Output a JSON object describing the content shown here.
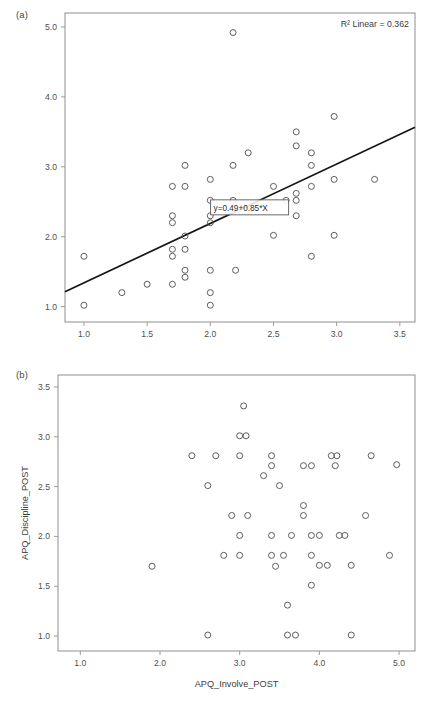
{
  "figure": {
    "panels": [
      {
        "tag": "(a)",
        "xlabel": "",
        "ylabel": "",
        "r2_label": "R² Linear = 0.362",
        "equation_label": "y=0.49+0.85*X",
        "x_ticks": [
          "1.0",
          "1.5",
          "2.0",
          "2.5",
          "3.0",
          "3.5"
        ],
        "y_ticks": [
          "1.0",
          "2.0",
          "3.0",
          "4.0",
          "5.0"
        ]
      },
      {
        "tag": "(b)",
        "xlabel": "APQ_Involve_POST",
        "ylabel": "APQ_Discipline_POST",
        "r2_label": "",
        "equation_label": "",
        "x_ticks": [
          "1.0",
          "2.0",
          "3.0",
          "4.0",
          "5.0"
        ],
        "y_ticks": [
          "1.0",
          "1.5",
          "2.0",
          "2.5",
          "3.0",
          "3.5"
        ]
      }
    ]
  },
  "colors": {
    "marker_stroke": "#555555",
    "fit_line": "#151515",
    "frame": "#9a9a9a",
    "text": "#3d3d3d",
    "background": "#ffffff"
  },
  "chart_data": [
    {
      "type": "scatter",
      "title": "(a)",
      "xlabel": "",
      "ylabel": "",
      "xlim": [
        0.85,
        3.62
      ],
      "ylim": [
        0.78,
        5.2
      ],
      "x_ticks": [
        1.0,
        1.5,
        2.0,
        2.5,
        3.0,
        3.5
      ],
      "y_ticks": [
        1.0,
        2.0,
        3.0,
        4.0,
        5.0
      ],
      "grid": false,
      "legend": "none",
      "annotations": [
        {
          "text": "R² Linear = 0.362",
          "position": "top-right"
        },
        {
          "text": "y=0.49+0.85*X",
          "position": "on-fit-line",
          "x": 2.05,
          "y": 2.42
        }
      ],
      "fit_line": {
        "type": "linear",
        "equation": "y=0.49+0.85*X",
        "intercept": 0.49,
        "slope": 0.85,
        "r_squared": 0.362
      },
      "points": [
        {
          "x": 1.0,
          "y": 1.72
        },
        {
          "x": 1.0,
          "y": 1.02
        },
        {
          "x": 1.3,
          "y": 1.2
        },
        {
          "x": 1.5,
          "y": 1.32
        },
        {
          "x": 1.7,
          "y": 2.72
        },
        {
          "x": 1.7,
          "y": 2.3
        },
        {
          "x": 1.7,
          "y": 2.2
        },
        {
          "x": 1.7,
          "y": 1.82
        },
        {
          "x": 1.7,
          "y": 1.72
        },
        {
          "x": 1.7,
          "y": 1.32
        },
        {
          "x": 1.8,
          "y": 3.02
        },
        {
          "x": 1.8,
          "y": 2.72
        },
        {
          "x": 1.8,
          "y": 2.01
        },
        {
          "x": 1.8,
          "y": 1.82
        },
        {
          "x": 1.8,
          "y": 1.52
        },
        {
          "x": 1.8,
          "y": 1.42
        },
        {
          "x": 2.0,
          "y": 2.82
        },
        {
          "x": 2.0,
          "y": 2.52
        },
        {
          "x": 2.0,
          "y": 2.3
        },
        {
          "x": 2.0,
          "y": 2.2
        },
        {
          "x": 2.0,
          "y": 1.52
        },
        {
          "x": 2.0,
          "y": 1.2
        },
        {
          "x": 2.0,
          "y": 1.02
        },
        {
          "x": 2.18,
          "y": 4.92
        },
        {
          "x": 2.18,
          "y": 3.02
        },
        {
          "x": 2.18,
          "y": 2.52
        },
        {
          "x": 2.2,
          "y": 1.52
        },
        {
          "x": 2.3,
          "y": 3.2
        },
        {
          "x": 2.5,
          "y": 2.72
        },
        {
          "x": 2.5,
          "y": 2.02
        },
        {
          "x": 2.6,
          "y": 2.52
        },
        {
          "x": 2.68,
          "y": 3.5
        },
        {
          "x": 2.68,
          "y": 3.3
        },
        {
          "x": 2.68,
          "y": 2.62
        },
        {
          "x": 2.68,
          "y": 2.52
        },
        {
          "x": 2.68,
          "y": 2.3
        },
        {
          "x": 2.8,
          "y": 3.2
        },
        {
          "x": 2.8,
          "y": 3.02
        },
        {
          "x": 2.8,
          "y": 2.72
        },
        {
          "x": 2.8,
          "y": 1.72
        },
        {
          "x": 2.98,
          "y": 3.72
        },
        {
          "x": 2.98,
          "y": 2.82
        },
        {
          "x": 2.98,
          "y": 2.02
        },
        {
          "x": 3.3,
          "y": 2.82
        }
      ]
    },
    {
      "type": "scatter",
      "title": "(b)",
      "xlabel": "APQ_Involve_POST",
      "ylabel": "APQ_Discipline_POST",
      "xlim": [
        0.72,
        5.2
      ],
      "ylim": [
        0.85,
        3.62
      ],
      "x_ticks": [
        1.0,
        2.0,
        3.0,
        4.0,
        5.0
      ],
      "y_ticks": [
        1.0,
        1.5,
        2.0,
        2.5,
        3.0,
        3.5
      ],
      "grid": false,
      "legend": "none",
      "annotations": [],
      "points": [
        {
          "x": 1.9,
          "y": 1.7
        },
        {
          "x": 2.4,
          "y": 2.81
        },
        {
          "x": 2.6,
          "y": 2.51
        },
        {
          "x": 2.6,
          "y": 1.01
        },
        {
          "x": 2.7,
          "y": 2.81
        },
        {
          "x": 2.8,
          "y": 1.81
        },
        {
          "x": 2.9,
          "y": 2.21
        },
        {
          "x": 3.0,
          "y": 3.01
        },
        {
          "x": 3.0,
          "y": 2.81
        },
        {
          "x": 3.0,
          "y": 2.01
        },
        {
          "x": 3.0,
          "y": 1.81
        },
        {
          "x": 3.05,
          "y": 3.31
        },
        {
          "x": 3.08,
          "y": 3.01
        },
        {
          "x": 3.1,
          "y": 2.21
        },
        {
          "x": 3.3,
          "y": 2.61
        },
        {
          "x": 3.4,
          "y": 2.81
        },
        {
          "x": 3.4,
          "y": 2.71
        },
        {
          "x": 3.4,
          "y": 2.01
        },
        {
          "x": 3.4,
          "y": 1.81
        },
        {
          "x": 3.45,
          "y": 1.7
        },
        {
          "x": 3.5,
          "y": 2.51
        },
        {
          "x": 3.55,
          "y": 1.81
        },
        {
          "x": 3.6,
          "y": 1.31
        },
        {
          "x": 3.6,
          "y": 1.01
        },
        {
          "x": 3.65,
          "y": 2.01
        },
        {
          "x": 3.7,
          "y": 1.01
        },
        {
          "x": 3.8,
          "y": 2.71
        },
        {
          "x": 3.8,
          "y": 2.31
        },
        {
          "x": 3.8,
          "y": 2.21
        },
        {
          "x": 3.9,
          "y": 2.71
        },
        {
          "x": 3.9,
          "y": 2.01
        },
        {
          "x": 3.9,
          "y": 1.81
        },
        {
          "x": 3.9,
          "y": 1.51
        },
        {
          "x": 4.0,
          "y": 2.01
        },
        {
          "x": 4.0,
          "y": 1.71
        },
        {
          "x": 4.1,
          "y": 1.71
        },
        {
          "x": 4.15,
          "y": 2.81
        },
        {
          "x": 4.2,
          "y": 2.71
        },
        {
          "x": 4.22,
          "y": 2.81
        },
        {
          "x": 4.25,
          "y": 2.01
        },
        {
          "x": 4.32,
          "y": 2.01
        },
        {
          "x": 4.4,
          "y": 1.71
        },
        {
          "x": 4.4,
          "y": 1.01
        },
        {
          "x": 4.58,
          "y": 2.21
        },
        {
          "x": 4.65,
          "y": 2.81
        },
        {
          "x": 4.88,
          "y": 1.81
        },
        {
          "x": 4.97,
          "y": 2.72
        }
      ]
    }
  ]
}
